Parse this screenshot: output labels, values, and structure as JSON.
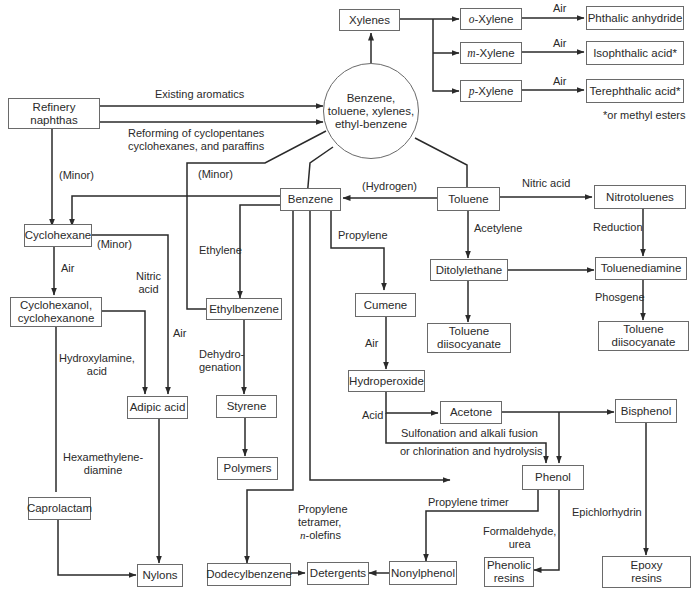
{
  "diagram": {
    "nodes": {
      "refinery_naphthas": "Refinery\nnaphthas",
      "btx_pool": "Benzene,\ntoluene, xylenes,\nethyl-benzene",
      "xylenes": "Xylenes",
      "o_xylene_prefix": "o",
      "o_xylene": "-Xylene",
      "m_xylene_prefix": "m",
      "m_xylene": "-Xylene",
      "p_xylene_prefix": "p",
      "p_xylene": "-Xylene",
      "phthalic_anhydride": "Phthalic anhydride",
      "isophthalic_acid": "Isophthalic acid*",
      "terephthalic_acid": "Terephthalic acid*",
      "benzene": "Benzene",
      "toluene": "Toluene",
      "nitrotoluenes": "Nitrotoluenes",
      "cyclohexane": "Cyclohexane",
      "cyclohexanol": "Cyclohexanol,\ncyclohexanone",
      "ethylbenzene": "Ethylbenzene",
      "cumene": "Cumene",
      "ditolylethane": "Ditolylethane",
      "toluenediamine": "Toluenediamine",
      "toluene_diisocyanate_1": "Toluene\ndiisocyanate",
      "toluene_diisocyanate_2": "Toluene\ndiisocyanate",
      "hydroperoxide": "Hydroperoxide",
      "adipic_acid": "Adipic acid",
      "styrene": "Styrene",
      "acetone": "Acetone",
      "bisphenol": "Bisphenol",
      "polymers": "Polymers",
      "phenol": "Phenol",
      "caprolactam": "Caprolactam",
      "nylons": "Nylons",
      "dodecylbenzene": "Dodecylbenzene",
      "detergents": "Detergents",
      "nonylphenol": "Nonylphenol",
      "phenolic_resins": "Phenolic\nresins",
      "epoxy_resins": "Epoxy\nresins"
    },
    "edge_labels": {
      "existing_aromatics": "Existing aromatics",
      "reforming": "Reforming of cyclopentanes\ncyclohexanes, and paraffins",
      "air_o": "Air",
      "air_m": "Air",
      "air_p": "Air",
      "footnote": "*or methyl esters",
      "minor_naphtha": "(Minor)",
      "minor_btx": "(Minor)",
      "hydrogen": "(Hydrogen)",
      "nitric_acid_toluene": "Nitric acid",
      "minor_cyclohexane": "(Minor)",
      "ethylene": "Ethylene",
      "propylene": "Propylene",
      "acetylene": "Acetylene",
      "reduction": "Reduction",
      "air_cyclohexane": "Air",
      "nitric_acid_adipic": "Nitric\nacid",
      "air_adipic": "Air",
      "phosgene": "Phosgene",
      "hydroxylamine": "Hydroxylamine,\nacid",
      "dehydrogenation": "Dehydro-\ngenation",
      "air_cumene": "Air",
      "acid": "Acid",
      "sulfonation": "Sulfonation and alkali fusion",
      "chlorination": "or chlorination and hydrolysis",
      "hexamethylenediamine": "Hexamethylene-\ndiamine",
      "propylene_trimer": "Propylene trimer",
      "epichlorhydrin": "Epichlorhydrin",
      "propylene_tetramer": "Propylene\ntetramer,",
      "n_olefins_prefix": "n",
      "n_olefins": "-olefins",
      "formaldehyde": "Formaldehyde,\nurea"
    },
    "colors": {
      "line": "#2a2a2a",
      "box_border": "#6a6a6a",
      "background": "#ffffff"
    }
  }
}
